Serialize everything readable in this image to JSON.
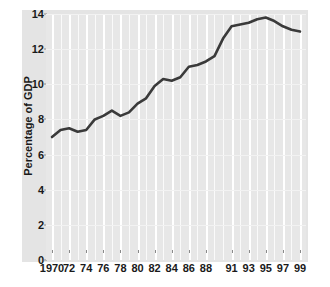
{
  "chart_data": {
    "type": "line",
    "title": "",
    "xlabel": "",
    "ylabel": "Percentage of GDP",
    "ylim": [
      0,
      14
    ],
    "xlim": [
      1970,
      1999
    ],
    "yticks": [
      0,
      2,
      4,
      6,
      8,
      10,
      12,
      14
    ],
    "ytick_labels": [
      "0",
      "2",
      "4",
      "6",
      "8",
      "10",
      "12",
      "14"
    ],
    "xtick_years": [
      1970,
      1972,
      1974,
      1976,
      1978,
      1980,
      1982,
      1984,
      1986,
      1988,
      1991,
      1993,
      1995,
      1997,
      1999
    ],
    "xtick_labels": [
      "1970",
      "72",
      "74",
      "76",
      "78",
      "80",
      "82",
      "84",
      "86",
      "88",
      "91",
      "93",
      "95",
      "97",
      "99"
    ],
    "grid": true,
    "grid_orientation": "vertical",
    "legend": "none",
    "line_color": "#3a3a3a",
    "line_width": 2.6,
    "plot_background": "#e7e7e7",
    "panel_background": "#e4e4e4",
    "gridline_color": "#ffffff",
    "x": [
      1970,
      1971,
      1972,
      1973,
      1974,
      1975,
      1976,
      1977,
      1978,
      1979,
      1980,
      1981,
      1982,
      1983,
      1984,
      1985,
      1986,
      1987,
      1988,
      1989,
      1990,
      1991,
      1992,
      1993,
      1994,
      1995,
      1996,
      1997,
      1998,
      1999
    ],
    "values": [
      7.0,
      7.4,
      7.5,
      7.3,
      7.4,
      8.0,
      8.2,
      8.5,
      8.2,
      8.4,
      8.9,
      9.2,
      9.9,
      10.3,
      10.2,
      10.4,
      11.0,
      11.1,
      11.3,
      11.6,
      12.6,
      13.3,
      13.4,
      13.5,
      13.7,
      13.8,
      13.6,
      13.3,
      13.1,
      13.0
    ]
  },
  "axes": {
    "ylabel": "Percentage of GDP"
  }
}
